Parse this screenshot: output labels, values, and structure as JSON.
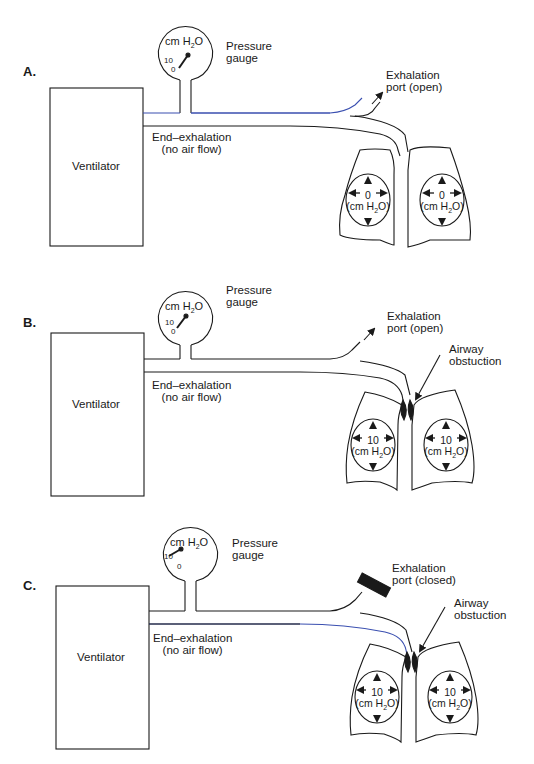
{
  "panels": [
    {
      "id": "A",
      "letter": "A.",
      "gauge": {
        "unit_prefix": "cm H",
        "unit_sub": "2",
        "unit_suffix": "O",
        "tick_high": "10",
        "tick_low": "0",
        "label_line1": "Pressure",
        "label_line2": "gauge",
        "reading": "0"
      },
      "ventilator_label": "Ventilator",
      "flow_label_line1": "End–exhalation",
      "flow_label_line2": "(no air flow)",
      "port_label_line1": "Exhalation",
      "port_label_line2": "port (open)",
      "obstruction_label": null,
      "lungs": [
        {
          "side": "left",
          "value": "0",
          "unit_prefix": "(cm H",
          "unit_sub": "2",
          "unit_suffix": "O)"
        },
        {
          "side": "right",
          "value": "0",
          "unit_prefix": "(cm H",
          "unit_sub": "2",
          "unit_suffix": "O)"
        }
      ]
    },
    {
      "id": "B",
      "letter": "B.",
      "gauge": {
        "unit_prefix": "cm H",
        "unit_sub": "2",
        "unit_suffix": "O",
        "tick_high": "10",
        "tick_low": "0",
        "label_line1": "Pressure",
        "label_line2": "gauge",
        "reading": "0"
      },
      "ventilator_label": "Ventilator",
      "flow_label_line1": "End–exhalation",
      "flow_label_line2": "(no air flow)",
      "port_label_line1": "Exhalation",
      "port_label_line2": "port (open)",
      "obstruction_label_line1": "Airway",
      "obstruction_label_line2": "obstuction",
      "lungs": [
        {
          "side": "left",
          "value": "10",
          "unit_prefix": "(cm H",
          "unit_sub": "2",
          "unit_suffix": "O)"
        },
        {
          "side": "right",
          "value": "10",
          "unit_prefix": "(cm H",
          "unit_sub": "2",
          "unit_suffix": "O)"
        }
      ]
    },
    {
      "id": "C",
      "letter": "C.",
      "gauge": {
        "unit_prefix": "cm H",
        "unit_sub": "2",
        "unit_suffix": "O",
        "tick_high": "10",
        "tick_low": "0",
        "label_line1": "Pressure",
        "label_line2": "gauge",
        "reading": "10"
      },
      "ventilator_label": "Ventilator",
      "flow_label_line1": "End–exhalation",
      "flow_label_line2": "(no air flow)",
      "port_label_line1": "Exhalation",
      "port_label_line2": "port (closed)",
      "obstruction_label_line1": "Airway",
      "obstruction_label_line2": "obstuction",
      "lungs": [
        {
          "side": "left",
          "value": "10",
          "unit_prefix": "(cm H",
          "unit_sub": "2",
          "unit_suffix": "O)"
        },
        {
          "side": "right",
          "value": "10",
          "unit_prefix": "(cm H",
          "unit_sub": "2",
          "unit_suffix": "O)"
        }
      ]
    }
  ],
  "colors": {
    "line": "#1a1a1a",
    "tube_accent": "#3a4fb0",
    "background": "#ffffff"
  }
}
